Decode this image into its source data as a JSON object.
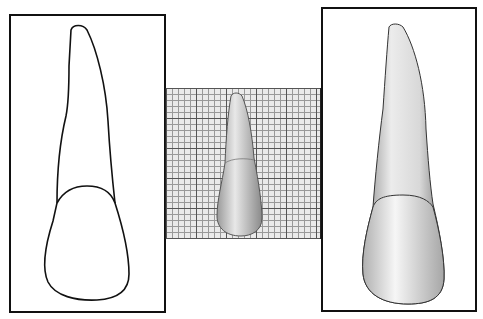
{
  "figure": {
    "panels": [
      {
        "id": "outline-drawing",
        "description": "Line drawing outline of tooth (root and crown)"
      },
      {
        "id": "grid-photo",
        "description": "Photograph of tooth on millimeter grid paper"
      },
      {
        "id": "tooth-photo",
        "description": "Enlarged photograph of tooth"
      }
    ],
    "colors": {
      "line": "#111111",
      "grid_major": "#555555",
      "grid_minor": "#999999",
      "grid_bg": "#eaeaea"
    }
  }
}
